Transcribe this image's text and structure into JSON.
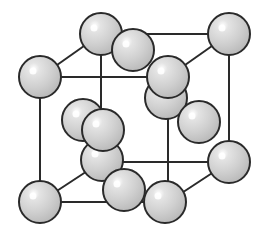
{
  "diagram": {
    "colors": {
      "edge": "#2a2a2a",
      "sphere_fill": "#c8c8c8",
      "sphere_stroke": "#2a2a2a",
      "highlight": "#ffffff",
      "background": "#ffffff"
    },
    "sphere_radius": 21,
    "edges": [
      [
        40,
        77,
        168,
        77
      ],
      [
        40,
        77,
        40,
        202
      ],
      [
        40,
        202,
        168,
        202
      ],
      [
        168,
        77,
        168,
        202
      ],
      [
        101,
        34,
        229,
        34
      ],
      [
        229,
        34,
        229,
        162
      ],
      [
        101,
        162,
        229,
        162
      ],
      [
        101,
        34,
        101,
        162
      ],
      [
        40,
        77,
        101,
        34
      ],
      [
        168,
        77,
        229,
        34
      ],
      [
        40,
        202,
        101,
        162
      ],
      [
        168,
        202,
        229,
        162
      ]
    ],
    "spheres": [
      {
        "name": "corner-back-top-left",
        "cx": 101,
        "cy": 34
      },
      {
        "name": "corner-back-top-right",
        "cx": 229,
        "cy": 34
      },
      {
        "name": "face-top",
        "cx": 133,
        "cy": 50
      },
      {
        "name": "face-back",
        "cx": 166,
        "cy": 98
      },
      {
        "name": "face-right",
        "cx": 199,
        "cy": 122
      },
      {
        "name": "face-left",
        "cx": 83,
        "cy": 120
      },
      {
        "name": "corner-back-bottom-left",
        "cx": 102,
        "cy": 160
      },
      {
        "name": "corner-front-top-left",
        "cx": 40,
        "cy": 77
      },
      {
        "name": "corner-front-top-right",
        "cx": 168,
        "cy": 77
      },
      {
        "name": "face-front",
        "cx": 103,
        "cy": 130
      },
      {
        "name": "corner-back-bottom-right",
        "cx": 229,
        "cy": 162
      },
      {
        "name": "face-bottom",
        "cx": 124,
        "cy": 190
      },
      {
        "name": "corner-front-bottom-left",
        "cx": 40,
        "cy": 202
      },
      {
        "name": "corner-front-bottom-right",
        "cx": 165,
        "cy": 202
      }
    ]
  }
}
